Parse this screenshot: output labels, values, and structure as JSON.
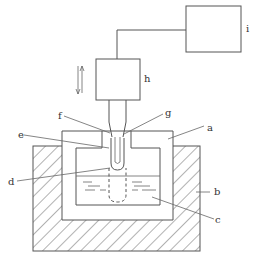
{
  "diagram": {
    "type": "apparatus-schematic",
    "labels": {
      "a": "a",
      "b": "b",
      "c": "c",
      "d": "d",
      "e": "e",
      "f": "f",
      "g": "g",
      "h": "h",
      "i": "i"
    },
    "components": [
      {
        "id": "a",
        "desc": "inner container with lid"
      },
      {
        "id": "b",
        "desc": "outer hatched insulating block"
      },
      {
        "id": "c",
        "desc": "liquid"
      },
      {
        "id": "d",
        "desc": "tube bottom (dashed extension in liquid)"
      },
      {
        "id": "e",
        "desc": "outer tube / sheath"
      },
      {
        "id": "f",
        "desc": "inner rod"
      },
      {
        "id": "g",
        "desc": "holder"
      },
      {
        "id": "h",
        "desc": "drive unit"
      },
      {
        "id": "i",
        "desc": "controller unit"
      }
    ],
    "motion_indicator": "up-down double arrow",
    "colors": {
      "line": "#555555",
      "background": "#ffffff",
      "text": "#333333"
    }
  }
}
